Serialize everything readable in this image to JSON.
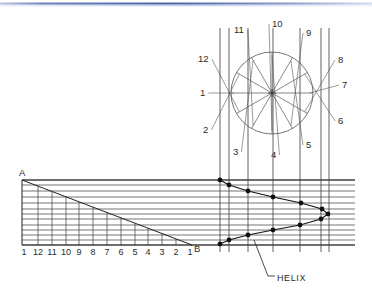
{
  "document": {
    "title": "Helix Construction Drawing",
    "type": "engineering-drawing"
  },
  "header_band": {
    "name": "top-divider-band",
    "color_left": "#aab8de",
    "color_mid": "#4a63a8",
    "color_right": "#c9d3ea"
  },
  "plan_view": {
    "label": "plan-circle-view",
    "circle": {
      "cx": 272,
      "cy": 93,
      "r": 41
    },
    "division_count": 12,
    "division_labels": [
      {
        "text": "1",
        "x": 200,
        "y": 96,
        "anchor": "start"
      },
      {
        "text": "2",
        "x": 203,
        "y": 133,
        "anchor": "start"
      },
      {
        "text": "3",
        "x": 233,
        "y": 155,
        "anchor": "start"
      },
      {
        "text": "4",
        "x": 271,
        "y": 158,
        "anchor": "start"
      },
      {
        "text": "5",
        "x": 306,
        "y": 148,
        "anchor": "start"
      },
      {
        "text": "6",
        "x": 338,
        "y": 124,
        "anchor": "start"
      },
      {
        "text": "7",
        "x": 342,
        "y": 88,
        "anchor": "start"
      },
      {
        "text": "8",
        "x": 338,
        "y": 63,
        "anchor": "start"
      },
      {
        "text": "9",
        "x": 306,
        "y": 36,
        "anchor": "start"
      },
      {
        "text": "10",
        "x": 272,
        "y": 27,
        "anchor": "start"
      },
      {
        "text": "11",
        "x": 234,
        "y": 33,
        "anchor": "start"
      },
      {
        "text": "12",
        "x": 198,
        "y": 62,
        "anchor": "start"
      }
    ]
  },
  "development_view": {
    "label": "triangular-development",
    "apex_label": "A",
    "base_end_label": "B",
    "apex_point": {
      "x": 22,
      "y": 180
    },
    "base_line_y": 245,
    "base_left_x": 22,
    "base_right_x": 355,
    "tick_labels": [
      "1",
      "12",
      "11",
      "10",
      "9",
      "8",
      "7",
      "6",
      "5",
      "4",
      "3",
      "2",
      "1"
    ],
    "tick_x": [
      24,
      38,
      52,
      66,
      79,
      93,
      107,
      121,
      135,
      148,
      162,
      176,
      190
    ],
    "tick_label_y": 255
  },
  "helix": {
    "callout_label": "HELIX",
    "callout_text_x": 277,
    "callout_text_y": 281,
    "leader": {
      "x1": 254,
      "y1": 240,
      "x2": 268,
      "y2": 276,
      "x3": 275,
      "y3": 276
    },
    "point_radius": 2.4,
    "points": [
      {
        "n": 1,
        "x": 220,
        "y": 180
      },
      {
        "n": 2,
        "x": 229,
        "y": 185
      },
      {
        "n": 3,
        "x": 248,
        "y": 191
      },
      {
        "n": 4,
        "x": 273,
        "y": 197
      },
      {
        "n": 5,
        "x": 301,
        "y": 203
      },
      {
        "n": 6,
        "x": 322,
        "y": 209
      },
      {
        "n": 7,
        "x": 328,
        "y": 214
      },
      {
        "n": 8,
        "x": 321,
        "y": 219
      },
      {
        "n": 9,
        "x": 300,
        "y": 225
      },
      {
        "n": 10,
        "x": 273,
        "y": 230
      },
      {
        "n": 11,
        "x": 248,
        "y": 235
      },
      {
        "n": 12,
        "x": 229,
        "y": 240
      },
      {
        "n": 13,
        "x": 220,
        "y": 244
      }
    ]
  },
  "projectors": {
    "label": "vertical-projector-lines",
    "x_positions": [
      220,
      229,
      248,
      273,
      300,
      321,
      329
    ],
    "top_y": 28,
    "bottom_y": 252
  },
  "horizontal_lines": {
    "label": "horizontal-projection-lines",
    "left_x": 22,
    "right_x": 355,
    "y_positions": [
      180,
      185,
      191,
      197,
      203,
      209,
      214,
      219,
      225,
      230,
      235,
      240,
      245
    ]
  },
  "colors": {
    "line": "#2b2b2b",
    "thin_line": "#555555",
    "background": "#ffffff",
    "dot": "#111111"
  }
}
